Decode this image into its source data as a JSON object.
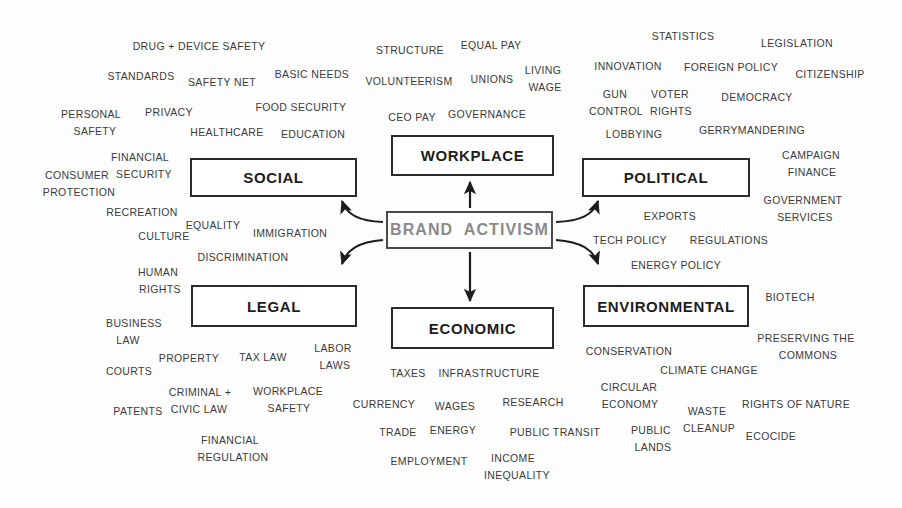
{
  "diagram": {
    "title": "Brand Activism",
    "center": {
      "label": "BRAND  ACTIVISM",
      "text_color": "#8a8a8a",
      "border_color": "#4a4a4a"
    },
    "categories": [
      {
        "id": "social",
        "label": "SOCIAL"
      },
      {
        "id": "workplace",
        "label": "WORKPLACE"
      },
      {
        "id": "political",
        "label": "POLITICAL"
      },
      {
        "id": "legal",
        "label": "LEGAL"
      },
      {
        "id": "economic",
        "label": "ECONOMIC"
      },
      {
        "id": "environmental",
        "label": "ENVIRONMENTAL"
      }
    ],
    "keyword_color": "#3b3b3b",
    "arrow_color": "#1d1d1d",
    "keywords": {
      "social": [
        "DRUG + DEVICE SAFETY",
        "STANDARDS",
        "SAFETY NET",
        "BASIC NEEDS",
        "PERSONAL\nSAFETY",
        "PRIVACY",
        "FOOD SECURITY",
        "HEALTHCARE",
        "EDUCATION",
        "FINANCIAL\nSECURITY",
        "CONSUMER\nPROTECTION",
        "RECREATION",
        "EQUALITY",
        "IMMIGRATION",
        "CULTURE",
        "DISCRIMINATION",
        "HUMAN\nRIGHTS"
      ],
      "workplace": [
        "STRUCTURE",
        "EQUAL PAY",
        "VOLUNTEERISM",
        "UNIONS",
        "LIVING\nWAGE",
        "CEO PAY",
        "GOVERNANCE"
      ],
      "political": [
        "STATISTICS",
        "LEGISLATION",
        "INNOVATION",
        "FOREIGN POLICY",
        "CITIZENSHIP",
        "GUN\nCONTROL",
        "VOTER\nRIGHTS",
        "DEMOCRACY",
        "LOBBYING",
        "GERRYMANDERING",
        "CAMPAIGN\nFINANCE",
        "GOVERNMENT\nSERVICES",
        "EXPORTS",
        "TECH POLICY",
        "REGULATIONS"
      ],
      "legal": [
        "BUSINESS\nLAW",
        "PROPERTY",
        "TAX LAW",
        "LABOR\nLAWS",
        "COURTS",
        "CRIMINAL +\nCIVIC LAW",
        "WORKPLACE\nSAFETY",
        "PATENTS",
        "FINANCIAL\nREGULATION"
      ],
      "economic": [
        "TAXES",
        "INFRASTRUCTURE",
        "CURRENCY",
        "WAGES",
        "RESEARCH",
        "TRADE",
        "ENERGY",
        "PUBLIC TRANSIT",
        "EMPLOYMENT",
        "INCOME\nINEQUALITY"
      ],
      "environmental": [
        "ENERGY POLICY",
        "BIOTECH",
        "CONSERVATION",
        "PRESERVING THE\nCOMMONS",
        "CLIMATE CHANGE",
        "CIRCULAR\nECONOMY",
        "WASTE\nCLEANUP",
        "RIGHTS OF NATURE",
        "PUBLIC\nLANDS",
        "ECOCIDE"
      ]
    },
    "placed_keywords": [
      {
        "text": "DRUG + DEVICE SAFETY",
        "x": 199,
        "y": 46,
        "size": 10.5,
        "cluster": "social"
      },
      {
        "text": "STANDARDS",
        "x": 141,
        "y": 76,
        "size": 10.5,
        "cluster": "social"
      },
      {
        "text": "SAFETY NET",
        "x": 222,
        "y": 82,
        "size": 10.5,
        "cluster": "social"
      },
      {
        "text": "BASIC NEEDS",
        "x": 312,
        "y": 74,
        "size": 10.5,
        "cluster": "social"
      },
      {
        "text": "PERSONAL",
        "x": 91,
        "y": 114,
        "size": 10.5,
        "cluster": "social"
      },
      {
        "text": "SAFETY",
        "x": 95,
        "y": 131,
        "size": 10.5,
        "cluster": "social"
      },
      {
        "text": "PRIVACY",
        "x": 169,
        "y": 112,
        "size": 10.5,
        "cluster": "social"
      },
      {
        "text": "FOOD SECURITY",
        "x": 301,
        "y": 107,
        "size": 10.5,
        "cluster": "social"
      },
      {
        "text": "HEALTHCARE",
        "x": 227,
        "y": 132,
        "size": 10.5,
        "cluster": "social"
      },
      {
        "text": "EDUCATION",
        "x": 313,
        "y": 134,
        "size": 10.5,
        "cluster": "social"
      },
      {
        "text": "FINANCIAL",
        "x": 140,
        "y": 157,
        "size": 10.5,
        "cluster": "social"
      },
      {
        "text": "SECURITY",
        "x": 144,
        "y": 174,
        "size": 10.5,
        "cluster": "social"
      },
      {
        "text": "CONSUMER",
        "x": 77,
        "y": 175,
        "size": 10.5,
        "cluster": "social"
      },
      {
        "text": "PROTECTION",
        "x": 79,
        "y": 192,
        "size": 10.5,
        "cluster": "social"
      },
      {
        "text": "RECREATION",
        "x": 142,
        "y": 212,
        "size": 10.5,
        "cluster": "social"
      },
      {
        "text": "EQUALITY",
        "x": 213,
        "y": 225,
        "size": 10.5,
        "cluster": "social"
      },
      {
        "text": "IMMIGRATION",
        "x": 290,
        "y": 233,
        "size": 10.5,
        "cluster": "social"
      },
      {
        "text": "CULTURE",
        "x": 164,
        "y": 236,
        "size": 10.5,
        "cluster": "social"
      },
      {
        "text": "DISCRIMINATION",
        "x": 243,
        "y": 257,
        "size": 10.5,
        "cluster": "social"
      },
      {
        "text": "HUMAN",
        "x": 158,
        "y": 272,
        "size": 10.5,
        "cluster": "social"
      },
      {
        "text": "RIGHTS",
        "x": 160,
        "y": 289,
        "size": 10.5,
        "cluster": "social"
      },
      {
        "text": "STRUCTURE",
        "x": 410,
        "y": 50,
        "size": 10.5,
        "cluster": "workplace"
      },
      {
        "text": "EQUAL PAY",
        "x": 491,
        "y": 45,
        "size": 10.5,
        "cluster": "workplace"
      },
      {
        "text": "VOLUNTEERISM",
        "x": 409,
        "y": 81,
        "size": 10.5,
        "cluster": "workplace"
      },
      {
        "text": "UNIONS",
        "x": 492,
        "y": 79,
        "size": 10.5,
        "cluster": "workplace"
      },
      {
        "text": "LIVING",
        "x": 543,
        "y": 70,
        "size": 10.5,
        "cluster": "workplace"
      },
      {
        "text": "WAGE",
        "x": 545,
        "y": 87,
        "size": 10.5,
        "cluster": "workplace"
      },
      {
        "text": "CEO PAY",
        "x": 412,
        "y": 117,
        "size": 10.5,
        "cluster": "workplace"
      },
      {
        "text": "GOVERNANCE",
        "x": 487,
        "y": 114,
        "size": 10.5,
        "cluster": "workplace"
      },
      {
        "text": "STATISTICS",
        "x": 683,
        "y": 36,
        "size": 10.5,
        "cluster": "political"
      },
      {
        "text": "LEGISLATION",
        "x": 797,
        "y": 43,
        "size": 10.5,
        "cluster": "political"
      },
      {
        "text": "INNOVATION",
        "x": 628,
        "y": 66,
        "size": 10.5,
        "cluster": "political"
      },
      {
        "text": "FOREIGN POLICY",
        "x": 731,
        "y": 67,
        "size": 10.5,
        "cluster": "political"
      },
      {
        "text": "CITIZENSHIP",
        "x": 830,
        "y": 74,
        "size": 10.5,
        "cluster": "political"
      },
      {
        "text": "GUN",
        "x": 615,
        "y": 94,
        "size": 10.5,
        "cluster": "political"
      },
      {
        "text": "CONTROL",
        "x": 616,
        "y": 111,
        "size": 10.5,
        "cluster": "political"
      },
      {
        "text": "VOTER",
        "x": 670,
        "y": 94,
        "size": 10.5,
        "cluster": "political"
      },
      {
        "text": "RIGHTS",
        "x": 671,
        "y": 111,
        "size": 10.5,
        "cluster": "political"
      },
      {
        "text": "DEMOCRACY",
        "x": 757,
        "y": 97,
        "size": 10.5,
        "cluster": "political"
      },
      {
        "text": "LOBBYING",
        "x": 634,
        "y": 134,
        "size": 10.5,
        "cluster": "political"
      },
      {
        "text": "GERRYMANDERING",
        "x": 752,
        "y": 130,
        "size": 10.5,
        "cluster": "political"
      },
      {
        "text": "CAMPAIGN",
        "x": 811,
        "y": 155,
        "size": 10.5,
        "cluster": "political"
      },
      {
        "text": "FINANCE",
        "x": 812,
        "y": 172,
        "size": 10.5,
        "cluster": "political"
      },
      {
        "text": "GOVERNMENT",
        "x": 803,
        "y": 200,
        "size": 10.5,
        "cluster": "political"
      },
      {
        "text": "SERVICES",
        "x": 805,
        "y": 217,
        "size": 10.5,
        "cluster": "political"
      },
      {
        "text": "EXPORTS",
        "x": 670,
        "y": 216,
        "size": 10.5,
        "cluster": "political"
      },
      {
        "text": "TECH POLICY",
        "x": 630,
        "y": 240,
        "size": 10.5,
        "cluster": "political"
      },
      {
        "text": "REGULATIONS",
        "x": 729,
        "y": 240,
        "size": 10.5,
        "cluster": "political"
      },
      {
        "text": "BUSINESS",
        "x": 134,
        "y": 323,
        "size": 10.5,
        "cluster": "legal"
      },
      {
        "text": "LAW",
        "x": 128,
        "y": 340,
        "size": 10.5,
        "cluster": "legal"
      },
      {
        "text": "PROPERTY",
        "x": 189,
        "y": 358,
        "size": 10.5,
        "cluster": "legal"
      },
      {
        "text": "TAX LAW",
        "x": 263,
        "y": 357,
        "size": 10.5,
        "cluster": "legal"
      },
      {
        "text": "LABOR",
        "x": 333,
        "y": 348,
        "size": 10.5,
        "cluster": "legal"
      },
      {
        "text": "LAWS",
        "x": 335,
        "y": 365,
        "size": 10.5,
        "cluster": "legal"
      },
      {
        "text": "COURTS",
        "x": 129,
        "y": 371,
        "size": 10.5,
        "cluster": "legal"
      },
      {
        "text": "CRIMINAL +",
        "x": 200,
        "y": 392,
        "size": 10.5,
        "cluster": "legal"
      },
      {
        "text": "CIVIC LAW",
        "x": 199,
        "y": 409,
        "size": 10.5,
        "cluster": "legal"
      },
      {
        "text": "WORKPLACE",
        "x": 288,
        "y": 391,
        "size": 10.5,
        "cluster": "legal"
      },
      {
        "text": "SAFETY",
        "x": 289,
        "y": 408,
        "size": 10.5,
        "cluster": "legal"
      },
      {
        "text": "PATENTS",
        "x": 138,
        "y": 411,
        "size": 10.5,
        "cluster": "legal"
      },
      {
        "text": "FINANCIAL",
        "x": 230,
        "y": 440,
        "size": 10.5,
        "cluster": "legal"
      },
      {
        "text": "REGULATION",
        "x": 233,
        "y": 457,
        "size": 10.5,
        "cluster": "legal"
      },
      {
        "text": "TAXES",
        "x": 408,
        "y": 373,
        "size": 10.5,
        "cluster": "economic"
      },
      {
        "text": "INFRASTRUCTURE",
        "x": 489,
        "y": 373,
        "size": 10.5,
        "cluster": "economic"
      },
      {
        "text": "CURRENCY",
        "x": 384,
        "y": 404,
        "size": 10.5,
        "cluster": "economic"
      },
      {
        "text": "WAGES",
        "x": 455,
        "y": 406,
        "size": 10.5,
        "cluster": "economic"
      },
      {
        "text": "RESEARCH",
        "x": 533,
        "y": 402,
        "size": 10.5,
        "cluster": "economic"
      },
      {
        "text": "TRADE",
        "x": 398,
        "y": 432,
        "size": 10.5,
        "cluster": "economic"
      },
      {
        "text": "ENERGY",
        "x": 453,
        "y": 430,
        "size": 10.5,
        "cluster": "economic"
      },
      {
        "text": "PUBLIC TRANSIT",
        "x": 555,
        "y": 432,
        "size": 10.5,
        "cluster": "economic"
      },
      {
        "text": "EMPLOYMENT",
        "x": 429,
        "y": 461,
        "size": 10.5,
        "cluster": "economic"
      },
      {
        "text": "INCOME",
        "x": 513,
        "y": 458,
        "size": 10.5,
        "cluster": "economic"
      },
      {
        "text": "INEQUALITY",
        "x": 517,
        "y": 475,
        "size": 10.5,
        "cluster": "economic"
      },
      {
        "text": "ENERGY POLICY",
        "x": 676,
        "y": 265,
        "size": 10.5,
        "cluster": "environmental"
      },
      {
        "text": "BIOTECH",
        "x": 790,
        "y": 297,
        "size": 10.5,
        "cluster": "environmental"
      },
      {
        "text": "PRESERVING THE",
        "x": 806,
        "y": 338,
        "size": 10.5,
        "cluster": "environmental"
      },
      {
        "text": "COMMONS",
        "x": 808,
        "y": 355,
        "size": 10.5,
        "cluster": "environmental"
      },
      {
        "text": "CONSERVATION",
        "x": 629,
        "y": 351,
        "size": 10.5,
        "cluster": "environmental"
      },
      {
        "text": "CLIMATE CHANGE",
        "x": 709,
        "y": 370,
        "size": 10.5,
        "cluster": "environmental"
      },
      {
        "text": "CIRCULAR",
        "x": 629,
        "y": 387,
        "size": 10.5,
        "cluster": "environmental"
      },
      {
        "text": "ECONOMY",
        "x": 630,
        "y": 404,
        "size": 10.5,
        "cluster": "environmental"
      },
      {
        "text": "WASTE",
        "x": 707,
        "y": 411,
        "size": 10.5,
        "cluster": "environmental"
      },
      {
        "text": "CLEANUP",
        "x": 709,
        "y": 428,
        "size": 10.5,
        "cluster": "environmental"
      },
      {
        "text": "RIGHTS OF NATURE",
        "x": 796,
        "y": 404,
        "size": 10.5,
        "cluster": "environmental"
      },
      {
        "text": "PUBLIC",
        "x": 651,
        "y": 430,
        "size": 10.5,
        "cluster": "environmental"
      },
      {
        "text": "LANDS",
        "x": 653,
        "y": 447,
        "size": 10.5,
        "cluster": "environmental"
      },
      {
        "text": "ECOCIDE",
        "x": 771,
        "y": 436,
        "size": 10.5,
        "cluster": "environmental"
      }
    ],
    "boxes": [
      {
        "id": "social",
        "x": 190,
        "y": 158,
        "w": 167,
        "h": 39
      },
      {
        "id": "workplace",
        "x": 391,
        "y": 135,
        "w": 163,
        "h": 41
      },
      {
        "id": "political",
        "x": 582,
        "y": 158,
        "w": 168,
        "h": 39
      },
      {
        "id": "legal",
        "x": 191,
        "y": 285,
        "w": 166,
        "h": 42
      },
      {
        "id": "economic",
        "x": 391,
        "y": 307,
        "w": 163,
        "h": 42
      },
      {
        "id": "environmental",
        "x": 583,
        "y": 285,
        "w": 166,
        "h": 42
      },
      {
        "id": "center",
        "x": 386,
        "y": 211,
        "w": 167,
        "h": 38
      }
    ]
  }
}
